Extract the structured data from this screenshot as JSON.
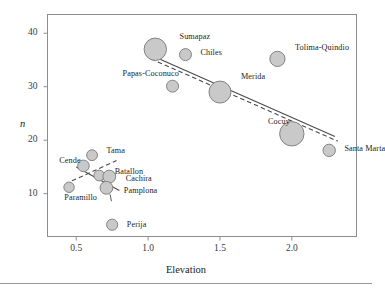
{
  "chart_data": {
    "type": "scatter",
    "title": "",
    "xlabel": "Elevation",
    "ylabel": "n",
    "xlim": [
      0.3,
      2.45
    ],
    "ylim": [
      2.0,
      43.5
    ],
    "xticks": [
      "0.5",
      "1.0",
      "1.5",
      "2.0"
    ],
    "xtick_values": [
      0.5,
      1.0,
      1.5,
      2.0
    ],
    "yticks": [
      "10",
      "20",
      "30",
      "40"
    ],
    "ytick_values": [
      10,
      20,
      30,
      40
    ],
    "grid": false,
    "legend": "none",
    "bubble_encoding": "marker area encodes an unlabeled magnitude",
    "marker_fill": "#c9c9c9",
    "marker_stroke": "#838383",
    "points": [
      {
        "label": "Sumapaz",
        "x": 1.05,
        "y": 37.0,
        "size": 11.2,
        "label_dx": 13,
        "label_dy": -13
      },
      {
        "label": "Chiles",
        "x": 1.26,
        "y": 36.0,
        "size": 6.0,
        "label_dx": 9,
        "label_dy": -3
      },
      {
        "label": "Tolima-Quindio",
        "x": 1.9,
        "y": 35.2,
        "size": 7.6,
        "label_dx": 10,
        "label_dy": -12
      },
      {
        "label": "Papas-Coconuco",
        "x": 1.17,
        "y": 30.1,
        "size": 6.0,
        "label_dx": -56,
        "label_dy": -13
      },
      {
        "label": "Merida",
        "x": 1.5,
        "y": 29.0,
        "size": 11.0,
        "label_dx": 10,
        "label_dy": -16
      },
      {
        "label": "Cocuy",
        "x": 2.0,
        "y": 21.2,
        "size": 12.2,
        "label_dx": -36,
        "label_dy": -13
      },
      {
        "label": "Santa Marta",
        "x": 2.26,
        "y": 18.1,
        "size": 6.2,
        "label_dx": 9,
        "label_dy": -2
      },
      {
        "label": "Tama",
        "x": 0.61,
        "y": 17.2,
        "size": 5.4,
        "label_dx": 9,
        "label_dy": -5
      },
      {
        "label": "Cende",
        "x": 0.55,
        "y": 15.2,
        "size": 5.8,
        "label_dx": -30,
        "label_dy": -6
      },
      {
        "label": "Batallon",
        "x": 0.66,
        "y": 13.4,
        "size": 5.4,
        "label_dx": 10,
        "label_dy": -5
      },
      {
        "label": "Cachira",
        "x": 0.73,
        "y": 13.2,
        "size": 6.4,
        "label_dx": 10,
        "label_dy": 1
      },
      {
        "label": "Pamplona",
        "x": 0.71,
        "y": 11.1,
        "size": 6.4,
        "label_dx": 11,
        "label_dy": 2
      },
      {
        "label": "Paramillo",
        "x": 0.45,
        "y": 11.2,
        "size": 5.2,
        "label_dx": -10,
        "label_dy": 10
      },
      {
        "label": "Perija",
        "x": 0.75,
        "y": 4.2,
        "size": 5.6,
        "label_dx": 9,
        "label_dy": -1
      }
    ],
    "fit_lines": [
      {
        "name": "main-solid",
        "style": "solid",
        "x1": 1.02,
        "y1": 35.9,
        "x2": 2.3,
        "y2": 20.7
      },
      {
        "name": "main-dashed",
        "style": "dashed",
        "x1": 1.02,
        "y1": 35.2,
        "x2": 2.32,
        "y2": 19.8
      },
      {
        "name": "cluster-solid",
        "style": "solid",
        "x1": 0.5,
        "y1": 15.0,
        "x2": 0.8,
        "y2": 10.6
      },
      {
        "name": "cluster-dashed",
        "style": "dashed",
        "x1": 0.47,
        "y1": 12.4,
        "x2": 0.78,
        "y2": 16.2
      }
    ],
    "leader_lines": [
      {
        "name": "batallon-leader",
        "x1": 0.655,
        "y1": 13.9,
        "x2": 0.645,
        "y2": 13.0
      },
      {
        "name": "pamplona-leader",
        "x1": 0.735,
        "y1": 9.9,
        "x2": 0.745,
        "y2": 8.6
      }
    ]
  }
}
